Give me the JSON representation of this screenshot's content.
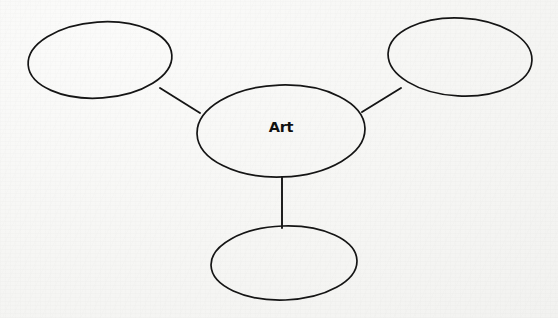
{
  "diagram": {
    "type": "concept-map",
    "title": "Art",
    "background_color": "#f7f7f5",
    "stroke_color": "#141414",
    "center_node": {
      "label": "Art",
      "cx": 281,
      "cy": 131,
      "rx": 84,
      "ry": 46,
      "rotation": -2,
      "filled": true
    },
    "branch_nodes": [
      {
        "name": "top-left-node",
        "label": "",
        "cx": 100,
        "cy": 60,
        "rx": 72,
        "ry": 38,
        "rotation": -4,
        "filled": false
      },
      {
        "name": "top-right-node",
        "label": "",
        "cx": 460,
        "cy": 57,
        "rx": 72,
        "ry": 39,
        "rotation": 3,
        "filled": false
      },
      {
        "name": "bottom-node",
        "label": "",
        "cx": 284,
        "cy": 263,
        "rx": 73,
        "ry": 37,
        "rotation": -2,
        "filled": false
      }
    ],
    "connectors": [
      {
        "name": "connector-center-to-top-left",
        "x1": 160,
        "y1": 88,
        "x2": 200,
        "y2": 113
      },
      {
        "name": "connector-center-to-top-right",
        "x1": 362,
        "y1": 112,
        "x2": 401,
        "y2": 88
      },
      {
        "name": "connector-center-to-bottom",
        "x1": 282,
        "y1": 177,
        "x2": 282,
        "y2": 228
      }
    ]
  }
}
